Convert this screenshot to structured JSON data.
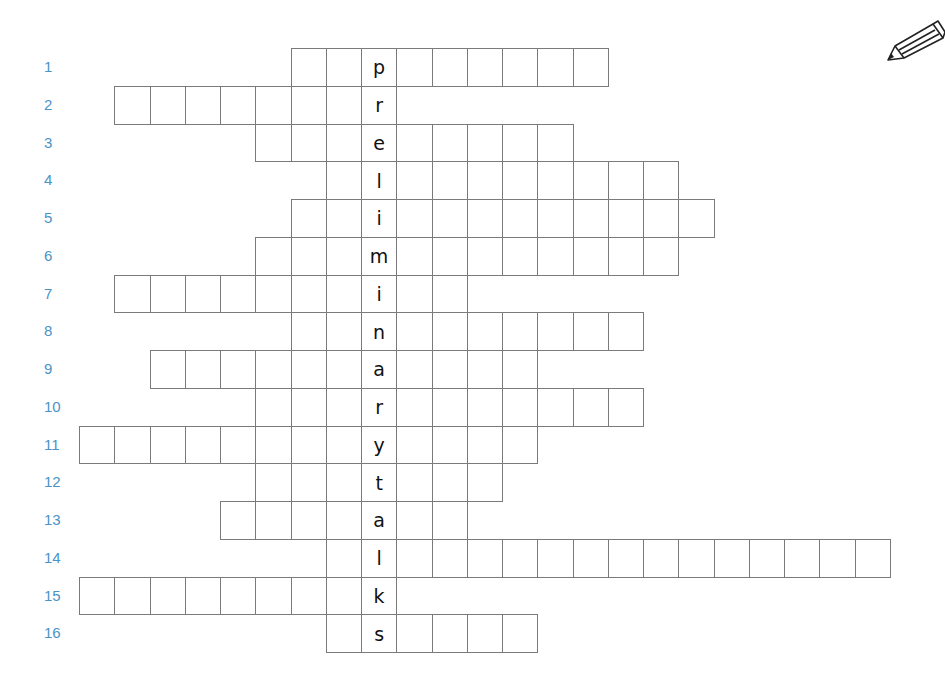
{
  "puzzle": {
    "type": "crossword",
    "vertical_answer": "preliminarytalks",
    "key_column": 8,
    "label_color": "#4a93c6",
    "rows": [
      {
        "number": "1",
        "start": 6,
        "end": 14,
        "letter": "p"
      },
      {
        "number": "2",
        "start": 1,
        "end": 8,
        "letter": "r"
      },
      {
        "number": "3",
        "start": 5,
        "end": 13,
        "letter": "e"
      },
      {
        "number": "4",
        "start": 7,
        "end": 16,
        "letter": "l"
      },
      {
        "number": "5",
        "start": 6,
        "end": 17,
        "letter": "i"
      },
      {
        "number": "6",
        "start": 5,
        "end": 16,
        "letter": "m"
      },
      {
        "number": "7",
        "start": 1,
        "end": 10,
        "letter": "i"
      },
      {
        "number": "8",
        "start": 6,
        "end": 15,
        "letter": "n"
      },
      {
        "number": "9",
        "start": 2,
        "end": 12,
        "letter": "a"
      },
      {
        "number": "10",
        "start": 5,
        "end": 15,
        "letter": "r"
      },
      {
        "number": "11",
        "start": 0,
        "end": 12,
        "letter": "y"
      },
      {
        "number": "12",
        "start": 5,
        "end": 11,
        "letter": "t"
      },
      {
        "number": "13",
        "start": 4,
        "end": 10,
        "letter": "a"
      },
      {
        "number": "14",
        "start": 7,
        "end": 22,
        "letter": "l"
      },
      {
        "number": "15",
        "start": 0,
        "end": 8,
        "letter": "k"
      },
      {
        "number": "16",
        "start": 7,
        "end": 12,
        "letter": "s"
      }
    ]
  },
  "icons": {
    "pencil": "pencil-icon"
  }
}
